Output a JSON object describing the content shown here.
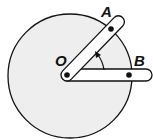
{
  "diagram": {
    "labels": {
      "pivot": "O",
      "point_a": "A",
      "point_b": "B"
    },
    "colors": {
      "disk_fill": "#eeeeee",
      "stroke": "#111111",
      "bar_fill": "#ffffff"
    }
  }
}
